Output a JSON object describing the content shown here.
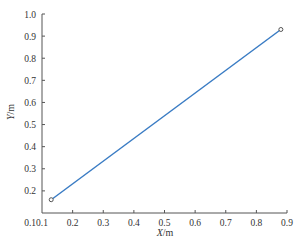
{
  "chart_data": {
    "type": "line",
    "title": "",
    "xlabel": "X/m",
    "ylabel": "Y/m",
    "xlim": [
      0.1,
      0.9
    ],
    "ylim": [
      0.1,
      1.0
    ],
    "grid": false,
    "legend": null,
    "x_ticks": [
      "0.1",
      "0.2",
      "0.3",
      "0.4",
      "0.5",
      "0.6",
      "0.7",
      "0.8",
      "0.9"
    ],
    "y_ticks": [
      "0.1",
      "0.2",
      "0.3",
      "0.4",
      "0.5",
      "0.6",
      "0.7",
      "0.8",
      "0.9",
      "1.0"
    ],
    "series": [
      {
        "name": "trajectory",
        "color": "#3a7cc4",
        "marker": "circle-open",
        "x": [
          0.13,
          0.88
        ],
        "y": [
          0.16,
          0.93
        ]
      }
    ]
  },
  "labels": {
    "xlabel_italic": "X",
    "xlabel_unit": "/m",
    "ylabel_italic": "Y",
    "ylabel_unit": "/m"
  }
}
